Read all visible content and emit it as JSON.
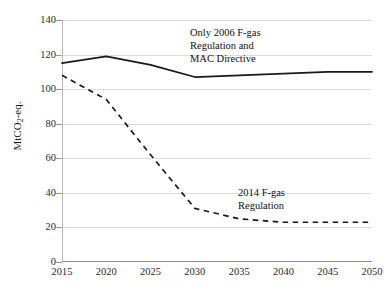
{
  "chart_data": {
    "type": "line",
    "title": "",
    "subtitle": "",
    "xlabel": "",
    "ylabel": "MtCO2-eq.",
    "ylabel_parts": {
      "prefix": "MtCO",
      "sub": "2",
      "suffix": "-eq."
    },
    "x": [
      2015,
      2020,
      2025,
      2030,
      2035,
      2040,
      2045,
      2050
    ],
    "xtick_labels": [
      "2015",
      "2020",
      "2025",
      "2030",
      "2035",
      "2040",
      "2045",
      "2050"
    ],
    "ytick_labels": [
      "0",
      "20",
      "40",
      "60",
      "80",
      "100",
      "120",
      "140"
    ],
    "yticks": [
      0,
      20,
      40,
      60,
      80,
      100,
      120,
      140
    ],
    "xlim": [
      2015,
      2050
    ],
    "ylim": [
      0,
      140
    ],
    "grid": "horizontal",
    "legend": "none",
    "series": [
      {
        "name": "Only 2006 F-gas Regulation and MAC Directive",
        "style": "solid",
        "color": "#1a1a1a",
        "values": [
          115,
          119,
          114,
          107,
          108,
          109,
          110,
          110
        ]
      },
      {
        "name": "2014 F-gas Regulation",
        "style": "dashed",
        "color": "#1a1a1a",
        "values": [
          108,
          94,
          62,
          31,
          25,
          23,
          23,
          23
        ]
      }
    ],
    "annotations": [
      {
        "id": "upper",
        "text": "Only 2006 F-gas\nRegulation and\nMAC Directive",
        "x": 2030,
        "y": 128
      },
      {
        "id": "lower",
        "text": "2014 F-gas\nRegulation",
        "x": 2040,
        "y": 44
      }
    ]
  }
}
